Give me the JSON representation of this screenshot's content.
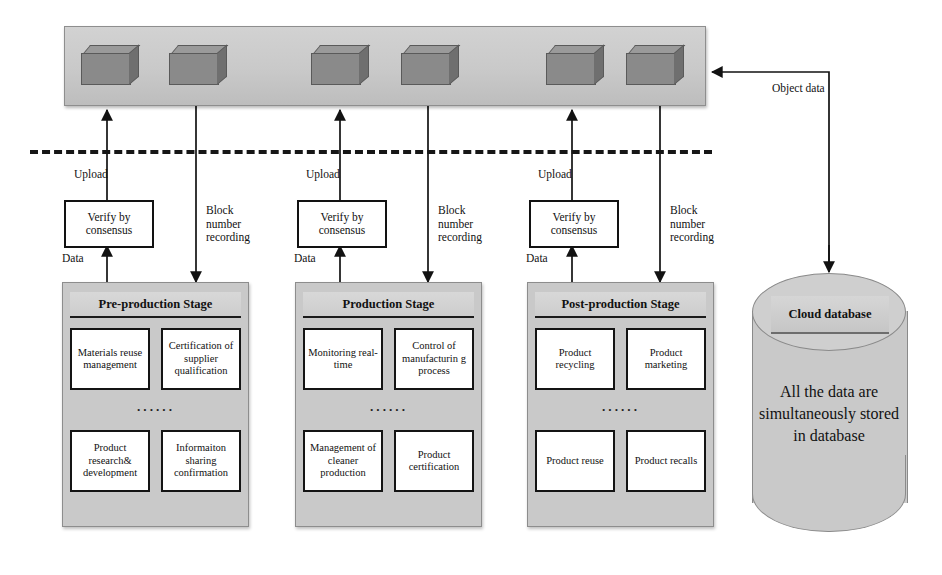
{
  "diagram": {
    "chain_bar": {
      "name": "blockchain-ledger-bar",
      "block_count": 6,
      "blocks": [
        "block-1",
        "block-2",
        "block-3",
        "block-4",
        "block-5",
        "block-6"
      ]
    },
    "object_data_label": "Object data",
    "flows": [
      {
        "upload": "Upload",
        "verify": "Verify by\nconsensus",
        "data": "Data",
        "record": "Block\nnumber\nrecording"
      },
      {
        "upload": "Upload",
        "verify": "Verify by\nconsensus",
        "data": "Data",
        "record": "Block\nnumber\nrecording"
      },
      {
        "upload": "Upload",
        "verify": "Verify by\nconsensus",
        "data": "Data",
        "record": "Block\nnumber\nrecording"
      }
    ],
    "stages": [
      {
        "title": "Pre-production Stage",
        "ellipsis": "······",
        "cells": [
          "Materials reuse management",
          "Certification of supplier qualification",
          "Product research& development",
          "Informaiton sharing confirmation"
        ]
      },
      {
        "title": "Production Stage",
        "ellipsis": "······",
        "cells": [
          "Monitoring real-time",
          "Control of manufacturin g process",
          "Management of cleaner production",
          "Product certification"
        ]
      },
      {
        "title": "Post-production Stage",
        "ellipsis": "······",
        "cells": [
          "Product recycling",
          "Product marketing",
          "Product reuse",
          "Product recalls"
        ]
      }
    ],
    "database": {
      "label": "Cloud database",
      "body_text": "All the data are simultaneously stored in database"
    },
    "colors": {
      "bar_fill": "#c9c9c9",
      "cube_fill": "#8a8a8a",
      "panel_fill": "#c9c9c9",
      "cell_fill": "#ffffff",
      "stroke": "#141414"
    }
  }
}
